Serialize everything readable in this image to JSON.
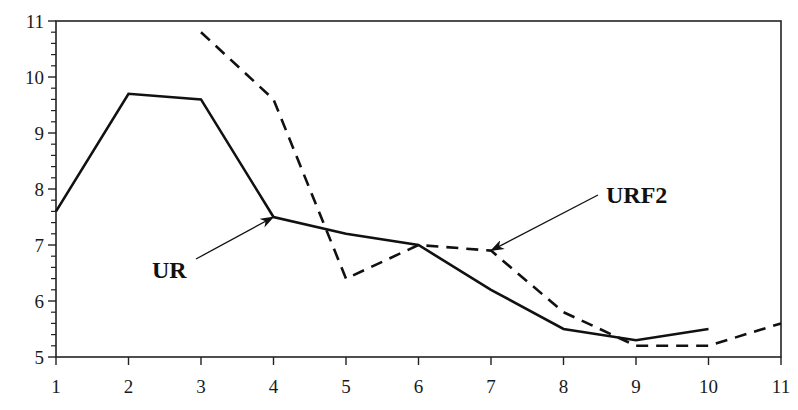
{
  "chart_data": {
    "type": "line",
    "title": "",
    "xlabel": "",
    "ylabel": "",
    "x": [
      1,
      2,
      3,
      4,
      5,
      6,
      7,
      8,
      9,
      10,
      11
    ],
    "xlim": [
      1,
      11
    ],
    "ylim": [
      5,
      11
    ],
    "x_ticks": [
      "1",
      "2",
      "3",
      "4",
      "5",
      "6",
      "7",
      "8",
      "9",
      "10",
      "11"
    ],
    "y_ticks": [
      "5",
      "6",
      "7",
      "8",
      "9",
      "10",
      "11"
    ],
    "y_minor_ticks_per_unit": 5,
    "grid": false,
    "legend": null,
    "series": [
      {
        "name": "UR",
        "style": "solid",
        "color": "#111111",
        "x": [
          1,
          2,
          3,
          4,
          5,
          6,
          7,
          8,
          9,
          10
        ],
        "values": [
          7.6,
          9.7,
          9.6,
          7.5,
          7.2,
          7.0,
          6.2,
          5.5,
          5.3,
          5.5
        ]
      },
      {
        "name": "URF2",
        "style": "dashed",
        "color": "#111111",
        "x": [
          3,
          4,
          5,
          6,
          7,
          8,
          9,
          10,
          11
        ],
        "values": [
          10.8,
          9.6,
          6.4,
          7.0,
          6.9,
          5.8,
          5.2,
          5.2,
          5.6
        ]
      }
    ],
    "annotations": [
      {
        "text": "UR",
        "series": "UR",
        "text_pos_px": [
          152,
          278
        ],
        "arrow_from_px": [
          196,
          259
        ],
        "arrow_to": [
          4,
          7.5
        ]
      },
      {
        "text": "URF2",
        "series": "URF2",
        "text_pos_px": [
          606,
          203
        ],
        "arrow_from_px": [
          598,
          195
        ],
        "arrow_to": [
          7,
          6.9
        ]
      }
    ]
  },
  "plot_area_px": {
    "left": 56,
    "right": 781,
    "top": 21,
    "bottom": 357
  }
}
